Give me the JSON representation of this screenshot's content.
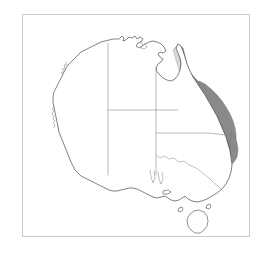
{
  "figure": {
    "kind": "thematic-distribution-map",
    "caption": "",
    "width_px": 271,
    "height_px": 259
  },
  "frame": {
    "border_color": "#cacaca",
    "background_color": "#ffffff",
    "left_px": 22,
    "top_px": 14,
    "width_px": 228,
    "height_px": 223
  },
  "map": {
    "projection_note": "",
    "coastline_color": "#4a4a4a",
    "land_fill": "#ffffff",
    "state_border_color": "#8e8e8e",
    "labels": []
  },
  "shading": {
    "description": "Shaded distribution band along the eastern seaboard and Great Dividing Range",
    "bands": [
      {
        "name": "outer-band",
        "color": "#8a8a8a",
        "opacity": 0.95
      },
      {
        "name": "middle-band",
        "color": "#b3b3b3",
        "opacity": 0.95
      },
      {
        "name": "inner-band",
        "color": "#d8d8d8",
        "opacity": 0.95
      }
    ],
    "extent_north": "Cape York / north Queensland",
    "extent_south": "south-eastern New South Wales"
  },
  "features": {
    "mainland": "Australian mainland coastline",
    "islands": [
      {
        "name": "tasmania"
      },
      {
        "name": "king-island"
      },
      {
        "name": "flinders-island"
      },
      {
        "name": "kangaroo-island"
      }
    ],
    "state_borders": [
      {
        "name": "wa-nt-sa-western-border"
      },
      {
        "name": "nt-qld-eastern-border"
      },
      {
        "name": "sa-northern-border"
      },
      {
        "name": "nsw-qld-border"
      },
      {
        "name": "nsw-sa-border"
      },
      {
        "name": "nsw-vic-murray-border"
      }
    ]
  },
  "legend": {
    "present": false,
    "items": []
  }
}
